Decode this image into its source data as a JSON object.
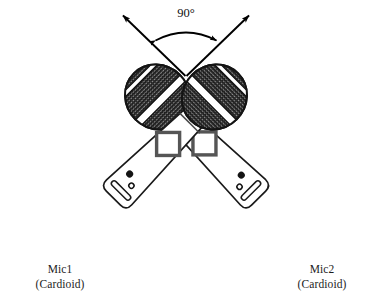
{
  "figure": {
    "background_color": "#ffffff",
    "line_color": "#1a1a1a",
    "mesh_color": "#2b2b2b",
    "accent_color": "#000000"
  },
  "angle": {
    "label": "90°",
    "value": 90,
    "unit": "degrees",
    "arc_style": "double-headed",
    "between": [
      "Mic1 axis",
      "Mic2 axis"
    ]
  },
  "microphones": [
    {
      "id": "mic1",
      "name": "Mic1",
      "pattern": "(Cardioid)",
      "position": "left",
      "tilt_degrees": -45,
      "parts": {
        "grille": "mesh-ball",
        "grille_band": "white diagonal stripe",
        "collar": "neck-band",
        "switch": "diamond-switch",
        "led": "indicator-dot",
        "screw": "small-circle",
        "vent": "base-slot"
      }
    },
    {
      "id": "mic2",
      "name": "Mic2",
      "pattern": "(Cardioid)",
      "position": "right",
      "tilt_degrees": 45,
      "parts": {
        "grille": "mesh-ball",
        "grille_band": "white diagonal stripe",
        "collar": "neck-band",
        "switch": "diamond-switch",
        "led": "indicator-dot",
        "screw": "small-circle",
        "vent": "base-slot"
      }
    }
  ],
  "arrows": [
    {
      "id": "mic1-axis-arrow",
      "direction": "up-left",
      "label": ""
    },
    {
      "id": "mic2-axis-arrow",
      "direction": "up-right",
      "label": ""
    }
  ]
}
